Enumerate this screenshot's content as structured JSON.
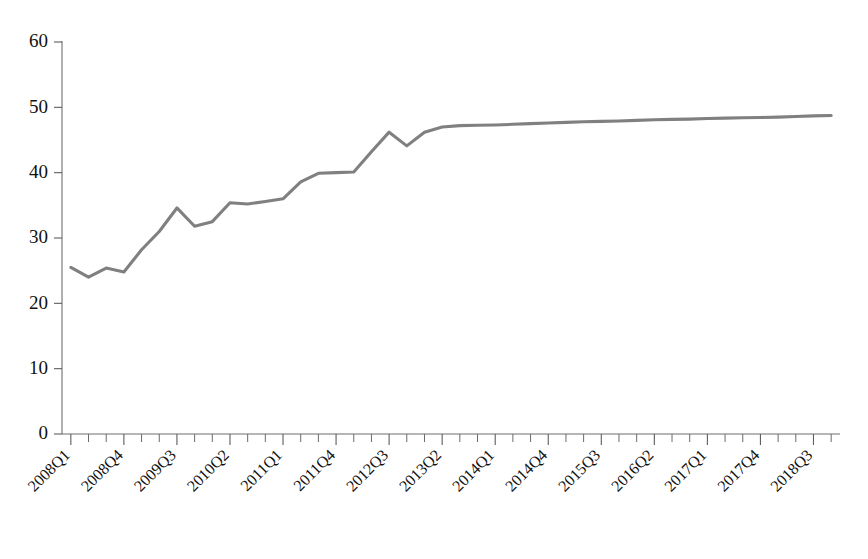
{
  "chart_data": {
    "type": "line",
    "title": "",
    "subtitle": "",
    "xlabel": "",
    "ylabel": "",
    "ylim": [
      0,
      60
    ],
    "yticks": [
      0,
      10,
      20,
      30,
      40,
      50,
      60
    ],
    "ytick_labels": [
      "0",
      "10",
      "20",
      "30",
      "40",
      "50",
      "60"
    ],
    "grid": false,
    "legend": false,
    "legend_position": "none",
    "series_color": "#808080",
    "axis_color": "#6f6f6f",
    "x_label_rotation_degrees": 45,
    "xtick_label_interval": 3,
    "xtick_labels": [
      "2008Q1",
      "2008Q4",
      "2009Q3",
      "2010Q2",
      "2011Q1",
      "2011Q4",
      "2012Q3",
      "2013Q2",
      "2014Q1",
      "2014Q4",
      "2015Q3",
      "2016Q2",
      "2017Q1",
      "2017Q4",
      "2018Q3"
    ],
    "x": [
      "2008Q1",
      "2008Q2",
      "2008Q3",
      "2008Q4",
      "2009Q1",
      "2009Q2",
      "2009Q3",
      "2009Q4",
      "2010Q1",
      "2010Q2",
      "2010Q3",
      "2010Q4",
      "2011Q1",
      "2011Q2",
      "2011Q3",
      "2011Q4",
      "2012Q1",
      "2012Q2",
      "2012Q3",
      "2012Q4",
      "2013Q1",
      "2013Q2",
      "2013Q3",
      "2013Q4",
      "2014Q1",
      "2014Q2",
      "2014Q3",
      "2014Q4",
      "2015Q1",
      "2015Q2",
      "2015Q3",
      "2015Q4",
      "2016Q1",
      "2016Q2",
      "2016Q3",
      "2016Q4",
      "2017Q1",
      "2017Q2",
      "2017Q3",
      "2017Q4",
      "2018Q1",
      "2018Q2",
      "2018Q3",
      "2018Q4"
    ],
    "values": [
      25.5,
      24.0,
      25.4,
      24.8,
      28.2,
      31.0,
      34.6,
      31.8,
      32.5,
      35.4,
      35.2,
      35.6,
      36.0,
      38.6,
      39.9,
      40.0,
      40.1,
      43.2,
      46.2,
      44.1,
      46.2,
      47.0,
      47.2,
      47.25,
      47.3,
      47.4,
      47.5,
      47.6,
      47.7,
      47.8,
      47.85,
      47.9,
      48.0,
      48.1,
      48.15,
      48.2,
      48.3,
      48.35,
      48.4,
      48.45,
      48.5,
      48.6,
      48.7,
      48.75
    ]
  },
  "caption": {
    "text": ""
  }
}
